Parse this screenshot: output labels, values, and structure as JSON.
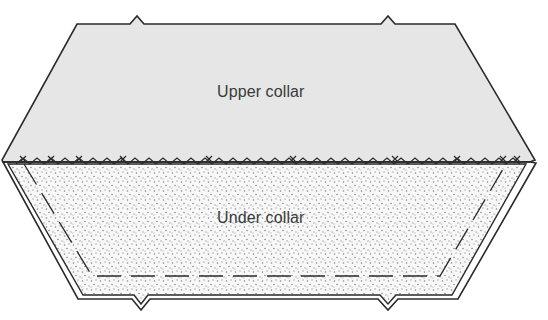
{
  "diagram": {
    "pieces": [
      {
        "id": "upper",
        "label": "Upper collar",
        "fill": "#e6e6e6"
      },
      {
        "id": "under",
        "label": "Under collar",
        "fill": "#f7f7f7",
        "pattern": "stipple-dots"
      }
    ],
    "features": {
      "seam": "zigzag cross-stitch seam joining upper and under collar",
      "stitch_line": "dashed stitching line inside under collar",
      "notches": 4
    },
    "colors": {
      "outline": "#2a2a2a",
      "upper_fill": "#e6e6e6",
      "under_fill": "#f8f8f8",
      "dots": "#8a8a8a",
      "label": "#3a3a3a"
    }
  }
}
